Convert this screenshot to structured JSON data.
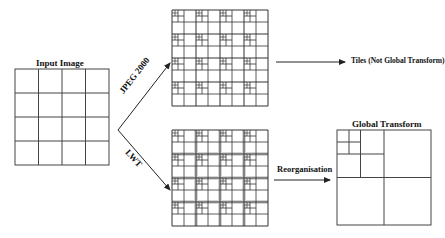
{
  "diagram": {
    "input": {
      "label": "Input Image",
      "grid": 4
    },
    "branches": {
      "top": {
        "label": "JPEG 2000",
        "result_label": "Tiles (Not Global Transform)"
      },
      "bottom": {
        "label": "LWT",
        "arrow_label": "Reorganisation",
        "result_label": "Global Transform"
      }
    },
    "colors": {
      "line": "#333333",
      "band": "#d6d6d6",
      "background": "#ffffff"
    }
  }
}
